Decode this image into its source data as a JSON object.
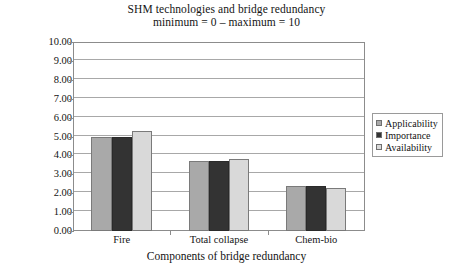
{
  "chart_data": {
    "type": "bar",
    "title": "SHM technologies and bridge redundancy",
    "subtitle": "minimum = 0 – maximum = 10",
    "xlabel": "Components of bridge redundancy",
    "ylabel": "",
    "categories": [
      "Fire",
      "Total collapse",
      "Chem-bio"
    ],
    "series": [
      {
        "name": "Applicability",
        "color": "#a9a9a9",
        "values": [
          5.0,
          3.7,
          2.4
        ]
      },
      {
        "name": "Importance",
        "color": "#333333",
        "values": [
          5.0,
          3.7,
          2.4
        ]
      },
      {
        "name": "Availability",
        "color": "#d9d9d9",
        "values": [
          5.3,
          3.8,
          2.3
        ]
      }
    ],
    "ylim": [
      0,
      10
    ],
    "ytick_step": 1,
    "ytick_labels": [
      "0.00",
      "1.00",
      "2.00",
      "3.00",
      "4.00",
      "5.00",
      "6.00",
      "7.00",
      "8.00",
      "9.00",
      "10.00"
    ],
    "grid": true,
    "grid_axis": "y",
    "legend_position": "right-outside"
  },
  "legend": {
    "items": [
      {
        "label": "Applicability",
        "color": "#a9a9a9"
      },
      {
        "label": "Importance",
        "color": "#333333"
      },
      {
        "label": "Availability",
        "color": "#d9d9d9"
      }
    ]
  },
  "colors": {
    "applicability": "#a9a9a9",
    "importance": "#333333",
    "availability": "#d9d9d9",
    "axis": "#8c8c8c",
    "grid": "#a8a8a8",
    "background": "#ffffff",
    "text": "#141414"
  }
}
